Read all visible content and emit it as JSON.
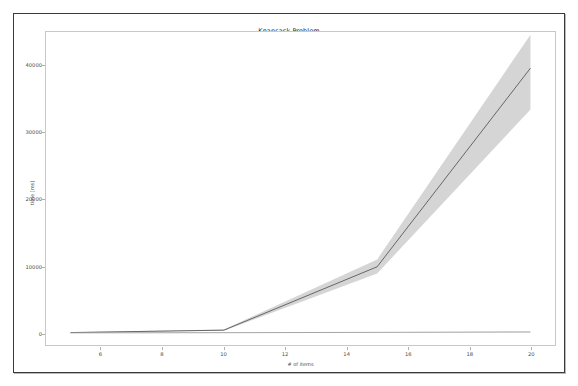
{
  "window": {
    "title": "Knapsack Problem"
  },
  "chart_data": {
    "type": "line",
    "title": "Knapsack Problem",
    "xlabel": "# of items",
    "ylabel": "time [ms]",
    "xlim": [
      4.2,
      20.8
    ],
    "ylim": [
      -1800,
      45000
    ],
    "grid": false,
    "legend": "none",
    "xticks": [
      6,
      8,
      10,
      12,
      14,
      16,
      18,
      20
    ],
    "yticks": [
      0,
      10000,
      20000,
      30000,
      40000
    ],
    "xtick_labels": [
      "6",
      "8",
      "10",
      "12",
      "14",
      "16",
      "18",
      "20"
    ],
    "ytick_labels": [
      "0",
      "10000",
      "20000",
      "30000",
      "40000"
    ],
    "x": [
      5,
      10,
      15,
      20
    ],
    "series": [
      {
        "name": "brute-force",
        "color": "#5a5a5a",
        "values": [
          60,
          420,
          9900,
          39600
        ],
        "band_lower": [
          40,
          330,
          8900,
          33400
        ],
        "band_upper": [
          90,
          520,
          11000,
          44600
        ],
        "band_color": "#bfbfbf"
      },
      {
        "name": "dynamic-programming",
        "color": "#9a9a9a",
        "values": [
          15,
          40,
          90,
          150
        ],
        "band_lower": [
          10,
          30,
          70,
          120
        ],
        "band_upper": [
          22,
          55,
          115,
          190
        ],
        "band_color": "#cfcfcf"
      }
    ]
  }
}
